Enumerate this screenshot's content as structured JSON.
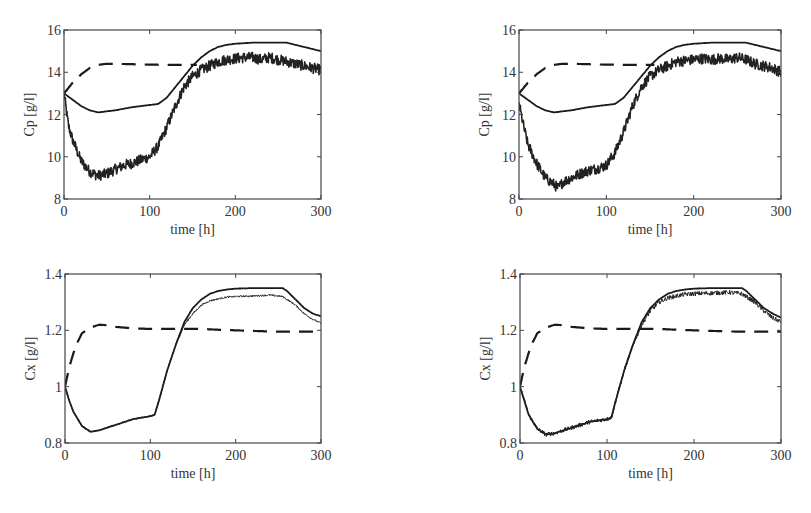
{
  "chart_data": [
    {
      "id": "cp_left",
      "type": "line",
      "title": "",
      "xlabel": "time [h]",
      "ylabel": "Cp [g/l]",
      "xlim": [
        0,
        300
      ],
      "ylim": [
        8,
        16
      ],
      "xticks": [
        0,
        100,
        200,
        300
      ],
      "yticks": [
        8,
        10,
        12,
        14,
        16
      ],
      "grid": false,
      "legend": "none",
      "series": [
        {
          "name": "solid",
          "style": "solid",
          "x": [
            0,
            10,
            20,
            30,
            40,
            50,
            60,
            80,
            100,
            110,
            120,
            130,
            140,
            150,
            160,
            170,
            180,
            190,
            200,
            220,
            240,
            260,
            280,
            300
          ],
          "values": [
            13.0,
            12.7,
            12.4,
            12.2,
            12.1,
            12.15,
            12.2,
            12.35,
            12.45,
            12.5,
            12.8,
            13.3,
            13.8,
            14.3,
            14.7,
            15.0,
            15.2,
            15.3,
            15.35,
            15.4,
            15.4,
            15.4,
            15.2,
            15.0
          ]
        },
        {
          "name": "dashed",
          "style": "dashed",
          "x": [
            0,
            10,
            20,
            30,
            40,
            50,
            60,
            80,
            100,
            120,
            140,
            155
          ],
          "values": [
            13.0,
            13.5,
            13.9,
            14.2,
            14.35,
            14.4,
            14.4,
            14.38,
            14.36,
            14.35,
            14.35,
            14.35
          ]
        },
        {
          "name": "noisy",
          "style": "noisy",
          "x": [
            0,
            5,
            10,
            20,
            30,
            40,
            50,
            60,
            70,
            80,
            90,
            100,
            110,
            120,
            130,
            140,
            150,
            160,
            170,
            180,
            190,
            200,
            210,
            220,
            230,
            240,
            250,
            260,
            270,
            280,
            290,
            300
          ],
          "values": [
            13.0,
            11.5,
            10.8,
            9.8,
            9.3,
            9.1,
            9.2,
            9.4,
            9.6,
            9.7,
            9.85,
            10.0,
            10.5,
            11.4,
            12.4,
            13.3,
            13.8,
            14.1,
            14.3,
            14.5,
            14.6,
            14.65,
            14.7,
            14.7,
            14.6,
            14.7,
            14.6,
            14.5,
            14.4,
            14.3,
            14.2,
            14.1
          ],
          "noise": 0.25
        }
      ]
    },
    {
      "id": "cp_right",
      "type": "line",
      "title": "",
      "xlabel": "time [h]",
      "ylabel": "Cp [g/l]",
      "xlim": [
        0,
        300
      ],
      "ylim": [
        8,
        16
      ],
      "xticks": [
        0,
        100,
        200,
        300
      ],
      "yticks": [
        8,
        10,
        12,
        14,
        16
      ],
      "grid": false,
      "legend": "none",
      "series": [
        {
          "name": "solid",
          "style": "solid",
          "x": [
            0,
            10,
            20,
            30,
            40,
            50,
            60,
            80,
            100,
            110,
            120,
            130,
            140,
            150,
            160,
            170,
            180,
            190,
            200,
            220,
            240,
            260,
            280,
            300
          ],
          "values": [
            13.0,
            12.7,
            12.4,
            12.2,
            12.1,
            12.15,
            12.2,
            12.35,
            12.45,
            12.5,
            12.8,
            13.3,
            13.8,
            14.3,
            14.7,
            15.0,
            15.2,
            15.3,
            15.35,
            15.4,
            15.4,
            15.4,
            15.2,
            15.0
          ]
        },
        {
          "name": "dashed",
          "style": "dashed",
          "x": [
            0,
            10,
            20,
            30,
            40,
            50,
            60,
            80,
            100,
            120,
            140,
            155
          ],
          "values": [
            13.0,
            13.5,
            13.9,
            14.2,
            14.35,
            14.4,
            14.4,
            14.38,
            14.36,
            14.35,
            14.35,
            14.35
          ]
        },
        {
          "name": "noisy",
          "style": "noisy",
          "x": [
            0,
            5,
            10,
            20,
            30,
            40,
            45,
            50,
            60,
            70,
            80,
            90,
            100,
            110,
            120,
            130,
            140,
            150,
            160,
            170,
            180,
            190,
            200,
            210,
            220,
            230,
            240,
            250,
            260,
            270,
            280,
            290,
            300
          ],
          "values": [
            12.5,
            11.5,
            10.6,
            9.7,
            9.0,
            8.7,
            8.5,
            8.8,
            9.0,
            9.2,
            9.35,
            9.45,
            9.6,
            10.2,
            11.2,
            12.4,
            13.3,
            13.8,
            14.1,
            14.3,
            14.5,
            14.55,
            14.6,
            14.65,
            14.6,
            14.65,
            14.6,
            14.7,
            14.6,
            14.4,
            14.3,
            14.2,
            14.0
          ],
          "noise": 0.25
        }
      ]
    },
    {
      "id": "cx_left",
      "type": "line",
      "title": "",
      "xlabel": "time [h]",
      "ylabel": "Cx [g/l]",
      "xlim": [
        0,
        300
      ],
      "ylim": [
        0.8,
        1.4
      ],
      "xticks": [
        0,
        100,
        200,
        300
      ],
      "yticks": [
        0.8,
        1,
        1.2,
        1.4
      ],
      "ytick_labels": [
        "0.8",
        "1",
        "1.2",
        "1.4"
      ],
      "grid": false,
      "legend": "none",
      "series": [
        {
          "name": "solid",
          "style": "solid",
          "x": [
            0,
            5,
            10,
            20,
            30,
            40,
            50,
            60,
            70,
            80,
            90,
            100,
            105,
            110,
            120,
            130,
            140,
            150,
            160,
            170,
            180,
            190,
            200,
            220,
            240,
            255,
            260,
            270,
            280,
            290,
            300
          ],
          "values": [
            1.0,
            0.95,
            0.91,
            0.86,
            0.84,
            0.845,
            0.855,
            0.865,
            0.875,
            0.885,
            0.89,
            0.895,
            0.9,
            0.95,
            1.06,
            1.15,
            1.23,
            1.28,
            1.31,
            1.33,
            1.34,
            1.345,
            1.348,
            1.35,
            1.35,
            1.35,
            1.34,
            1.31,
            1.28,
            1.26,
            1.25
          ]
        },
        {
          "name": "dashed",
          "style": "dashed",
          "x": [
            0,
            5,
            10,
            15,
            20,
            30,
            40,
            50,
            60,
            80,
            100,
            120,
            140,
            160,
            180,
            200,
            220,
            240,
            260,
            280,
            300
          ],
          "values": [
            1.0,
            1.07,
            1.12,
            1.16,
            1.19,
            1.21,
            1.22,
            1.218,
            1.212,
            1.207,
            1.205,
            1.205,
            1.205,
            1.205,
            1.202,
            1.2,
            1.198,
            1.196,
            1.195,
            1.195,
            1.195
          ]
        },
        {
          "name": "noisy",
          "style": "noisy",
          "x": [
            0,
            5,
            10,
            20,
            30,
            40,
            50,
            60,
            70,
            80,
            90,
            100,
            105,
            110,
            120,
            130,
            140,
            150,
            160,
            170,
            180,
            190,
            200,
            220,
            240,
            255,
            260,
            270,
            280,
            290,
            300
          ],
          "values": [
            1.0,
            0.95,
            0.91,
            0.86,
            0.84,
            0.845,
            0.855,
            0.865,
            0.875,
            0.885,
            0.89,
            0.895,
            0.9,
            0.95,
            1.06,
            1.15,
            1.22,
            1.26,
            1.29,
            1.305,
            1.312,
            1.318,
            1.32,
            1.322,
            1.325,
            1.32,
            1.31,
            1.29,
            1.26,
            1.24,
            1.225
          ],
          "noise": 0.003
        }
      ]
    },
    {
      "id": "cx_right",
      "type": "line",
      "title": "",
      "xlabel": "time [h]",
      "ylabel": "Cx [g/l]",
      "xlim": [
        0,
        300
      ],
      "ylim": [
        0.8,
        1.4
      ],
      "xticks": [
        0,
        100,
        200,
        300
      ],
      "yticks": [
        0.8,
        1,
        1.2,
        1.4
      ],
      "ytick_labels": [
        "0.8",
        "1",
        "1.2",
        "1.4"
      ],
      "grid": false,
      "legend": "none",
      "series": [
        {
          "name": "solid",
          "style": "solid",
          "x": [
            0,
            5,
            10,
            20,
            30,
            40,
            50,
            60,
            70,
            80,
            90,
            100,
            105,
            110,
            120,
            130,
            140,
            150,
            160,
            170,
            180,
            190,
            200,
            220,
            240,
            255,
            260,
            270,
            280,
            290,
            300
          ],
          "values": [
            1.0,
            0.95,
            0.9,
            0.85,
            0.83,
            0.835,
            0.845,
            0.855,
            0.865,
            0.875,
            0.88,
            0.885,
            0.89,
            0.95,
            1.06,
            1.15,
            1.23,
            1.28,
            1.31,
            1.33,
            1.34,
            1.345,
            1.348,
            1.35,
            1.35,
            1.35,
            1.34,
            1.31,
            1.28,
            1.26,
            1.245
          ]
        },
        {
          "name": "dashed",
          "style": "dashed",
          "x": [
            0,
            5,
            10,
            15,
            20,
            30,
            40,
            50,
            60,
            80,
            100,
            120,
            140,
            160,
            180,
            200,
            220,
            240,
            260,
            280,
            300
          ],
          "values": [
            1.0,
            1.07,
            1.12,
            1.16,
            1.19,
            1.21,
            1.22,
            1.218,
            1.212,
            1.207,
            1.205,
            1.205,
            1.205,
            1.205,
            1.202,
            1.2,
            1.198,
            1.196,
            1.195,
            1.195,
            1.195
          ]
        },
        {
          "name": "noisy",
          "style": "noisy",
          "x": [
            0,
            5,
            10,
            20,
            30,
            40,
            50,
            60,
            70,
            80,
            90,
            100,
            105,
            110,
            120,
            130,
            140,
            150,
            160,
            170,
            180,
            190,
            200,
            220,
            240,
            255,
            260,
            270,
            280,
            290,
            300
          ],
          "values": [
            1.0,
            0.95,
            0.9,
            0.85,
            0.83,
            0.835,
            0.845,
            0.855,
            0.865,
            0.875,
            0.88,
            0.885,
            0.89,
            0.95,
            1.06,
            1.15,
            1.22,
            1.27,
            1.3,
            1.315,
            1.322,
            1.328,
            1.33,
            1.332,
            1.335,
            1.33,
            1.32,
            1.3,
            1.27,
            1.245,
            1.23
          ],
          "noise": 0.008
        }
      ]
    }
  ]
}
